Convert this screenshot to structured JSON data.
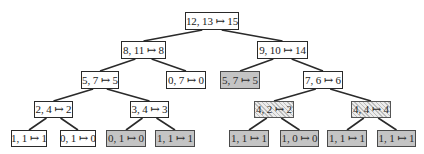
{
  "diagram": {
    "type": "binary-tree",
    "colors": {
      "plain_fill": "#ffffff",
      "gray_fill": "#c4c4c4",
      "hatched_fill": "#e6e6e6",
      "edge": "#2a2a2a"
    },
    "nodes": [
      {
        "id": "n0",
        "label": "12, 13 ↦ 15",
        "style": "plain",
        "x": 185,
        "y": 12,
        "w": 54,
        "h": 18
      },
      {
        "id": "n1",
        "label": "8, 11 ↦ 8",
        "style": "plain",
        "x": 121,
        "y": 41,
        "w": 45,
        "h": 18
      },
      {
        "id": "n2",
        "label": "9, 10 ↦ 14",
        "style": "plain",
        "x": 257,
        "y": 41,
        "w": 51,
        "h": 18
      },
      {
        "id": "n3",
        "label": "5, 7 ↦ 5",
        "style": "plain",
        "x": 81,
        "y": 71,
        "w": 38,
        "h": 18
      },
      {
        "id": "n4",
        "label": "0, 7 ↦ 0",
        "style": "plain",
        "x": 166,
        "y": 71,
        "w": 40,
        "h": 18
      },
      {
        "id": "n5",
        "label": "5, 7 ↦ 5",
        "style": "gray",
        "x": 220,
        "y": 71,
        "w": 40,
        "h": 18
      },
      {
        "id": "n6",
        "label": "7, 6 ↦ 6",
        "style": "plain",
        "x": 303,
        "y": 71,
        "w": 40,
        "h": 18
      },
      {
        "id": "n7",
        "label": "2, 4 ↦ 2",
        "style": "plain",
        "x": 34,
        "y": 101,
        "w": 39,
        "h": 17
      },
      {
        "id": "n8",
        "label": "3, 4 ↦ 3",
        "style": "plain",
        "x": 130,
        "y": 101,
        "w": 39,
        "h": 17
      },
      {
        "id": "n9",
        "label": "4, 2 ↦ 2",
        "style": "hatched",
        "x": 254,
        "y": 101,
        "w": 40,
        "h": 17
      },
      {
        "id": "n10",
        "label": "4, 4 ↦ 4",
        "style": "hatched",
        "x": 351,
        "y": 101,
        "w": 40,
        "h": 17
      },
      {
        "id": "n11",
        "label": "1, 1 ↦ 1",
        "style": "plain",
        "x": 11,
        "y": 130,
        "w": 36,
        "h": 17
      },
      {
        "id": "n12",
        "label": "0, 1 ↦ 0",
        "style": "plain",
        "x": 60,
        "y": 130,
        "w": 36,
        "h": 17
      },
      {
        "id": "n13",
        "label": "0, 1 ↦ 0",
        "style": "gray",
        "x": 106,
        "y": 130,
        "w": 40,
        "h": 17
      },
      {
        "id": "n14",
        "label": "1, 1 ↦ 1",
        "style": "gray",
        "x": 155,
        "y": 130,
        "w": 40,
        "h": 17
      },
      {
        "id": "n15",
        "label": "1, 1 ↦ 1",
        "style": "gray",
        "x": 229,
        "y": 130,
        "w": 40,
        "h": 17
      },
      {
        "id": "n16",
        "label": "1, 0 ↦ 0",
        "style": "gray",
        "x": 280,
        "y": 130,
        "w": 39,
        "h": 17
      },
      {
        "id": "n17",
        "label": "1, 1 ↦ 1",
        "style": "gray",
        "x": 327,
        "y": 130,
        "w": 40,
        "h": 17
      },
      {
        "id": "n18",
        "label": "1, 1 ↦ 1",
        "style": "gray",
        "x": 377,
        "y": 130,
        "w": 39,
        "h": 17
      }
    ],
    "edges": [
      [
        "n0",
        "n1"
      ],
      [
        "n0",
        "n2"
      ],
      [
        "n1",
        "n3"
      ],
      [
        "n1",
        "n4"
      ],
      [
        "n2",
        "n5"
      ],
      [
        "n2",
        "n6"
      ],
      [
        "n3",
        "n7"
      ],
      [
        "n3",
        "n8"
      ],
      [
        "n6",
        "n9"
      ],
      [
        "n6",
        "n10"
      ],
      [
        "n7",
        "n11"
      ],
      [
        "n7",
        "n12"
      ],
      [
        "n8",
        "n13"
      ],
      [
        "n8",
        "n14"
      ],
      [
        "n9",
        "n15"
      ],
      [
        "n9",
        "n16"
      ],
      [
        "n10",
        "n17"
      ],
      [
        "n10",
        "n18"
      ]
    ]
  }
}
